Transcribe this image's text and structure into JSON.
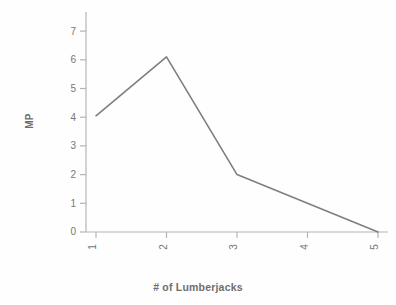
{
  "chart_data": {
    "type": "line",
    "title": "",
    "xlabel": "# of Lumberjacks",
    "ylabel": "MP",
    "x": [
      1,
      2,
      3,
      4,
      5
    ],
    "categories": [
      "1",
      "2",
      "3",
      "4",
      "5"
    ],
    "values": [
      4.05,
      6.1,
      2.0,
      1.0,
      0.0
    ],
    "series": [
      {
        "name": "MP",
        "values": [
          4.05,
          6.1,
          2.0,
          1.0,
          0.0
        ]
      }
    ],
    "xlim": [
      1,
      5
    ],
    "ylim": [
      0,
      7
    ],
    "y_ticks": [
      "0",
      "1",
      "2",
      "3",
      "4",
      "5",
      "6",
      "7"
    ],
    "x_ticks": [
      "1",
      "2",
      "3",
      "4",
      "5"
    ],
    "grid": false,
    "legend": false,
    "legend_position": "none",
    "line_color": "#7f7f7f",
    "axis_color": "#b4b4b4",
    "text_color": "#777777",
    "title_color": "#6e6e6e",
    "background_color": "#fefefe",
    "annotations": []
  }
}
